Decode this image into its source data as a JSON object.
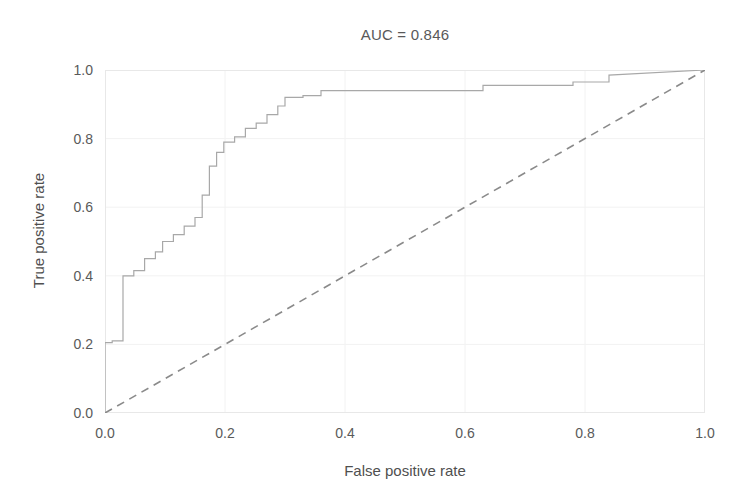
{
  "chart_data": {
    "type": "line",
    "title": "AUC = 0.846",
    "xlabel": "False positive rate",
    "ylabel": "True positive rate",
    "xlim": [
      0.0,
      1.0
    ],
    "ylim": [
      0.0,
      1.0
    ],
    "grid": true,
    "legend": "none",
    "auc": 0.846,
    "xticks": [
      "0.0",
      "0.2",
      "0.4",
      "0.6",
      "0.8",
      "1.0"
    ],
    "xtick_values": [
      0.0,
      0.2,
      0.4,
      0.6,
      0.8,
      1.0
    ],
    "yticks": [
      "0.0",
      "0.2",
      "0.4",
      "0.6",
      "0.8",
      "1.0"
    ],
    "ytick_values": [
      0.0,
      0.2,
      0.4,
      0.6,
      0.8,
      1.0
    ],
    "series": [
      {
        "name": "ROC curve",
        "style": "step",
        "color": "#a8a8a8",
        "linewidth": 1.2,
        "dash": "none",
        "x": [
          0.0,
          0.0,
          0.012,
          0.012,
          0.03,
          0.03,
          0.03,
          0.048,
          0.048,
          0.066,
          0.066,
          0.084,
          0.084,
          0.096,
          0.096,
          0.114,
          0.114,
          0.132,
          0.132,
          0.15,
          0.15,
          0.162,
          0.162,
          0.174,
          0.174,
          0.186,
          0.186,
          0.198,
          0.198,
          0.216,
          0.216,
          0.234,
          0.234,
          0.252,
          0.252,
          0.27,
          0.27,
          0.288,
          0.288,
          0.3,
          0.3,
          0.33,
          0.33,
          0.36,
          0.36,
          0.63,
          0.63,
          0.78,
          0.78,
          0.84,
          0.84,
          1.0
        ],
        "y": [
          0.0,
          0.205,
          0.205,
          0.21,
          0.21,
          0.38,
          0.4,
          0.4,
          0.415,
          0.415,
          0.45,
          0.45,
          0.47,
          0.47,
          0.5,
          0.5,
          0.52,
          0.52,
          0.545,
          0.545,
          0.57,
          0.57,
          0.635,
          0.635,
          0.72,
          0.72,
          0.76,
          0.76,
          0.79,
          0.79,
          0.805,
          0.805,
          0.83,
          0.83,
          0.845,
          0.845,
          0.87,
          0.87,
          0.895,
          0.895,
          0.92,
          0.92,
          0.925,
          0.925,
          0.94,
          0.94,
          0.955,
          0.955,
          0.965,
          0.965,
          0.985,
          1.0
        ]
      },
      {
        "name": "chance diagonal",
        "style": "line",
        "color": "#8a8a8a",
        "linewidth": 1.6,
        "dash": "8 6",
        "x": [
          0.0,
          1.0
        ],
        "y": [
          0.0,
          1.0
        ]
      }
    ]
  },
  "plot": {
    "left_px": 105,
    "top_px": 70,
    "width_px": 600,
    "height_px": 343,
    "grid_color": "#f2f2f2",
    "spine_color": "#e8e8e8",
    "background": "#ffffff"
  }
}
